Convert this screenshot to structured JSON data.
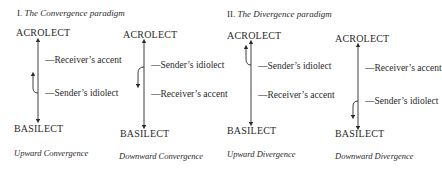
{
  "paradigms": [
    {
      "numeral": "I.",
      "title": "The Convergence paradigm",
      "diagrams": [
        {
          "top": "ACROLECT",
          "bottom": "BASILECT",
          "upper_label": "—Receiver’s accent",
          "lower_label": "—Sender’s idiolect",
          "shift_arrow": "up",
          "caption": "Upward Convergence"
        },
        {
          "top": "ACROLECT",
          "bottom": "BASILECT",
          "upper_label": "—Sender’s idiolect",
          "lower_label": "—Receiver’s accent",
          "shift_arrow": "down",
          "caption": "Downward Convergence"
        }
      ]
    },
    {
      "numeral": "II.",
      "title": "The Divergence paradigm",
      "diagrams": [
        {
          "top": "ACROLECT",
          "bottom": "BASILECT",
          "upper_label": "—Sender’s idiolect",
          "lower_label": "—Receiver’s accent",
          "shift_arrow": "up",
          "caption": "Upward Divergence"
        },
        {
          "top": "ACROLECT",
          "bottom": "BASILECT",
          "upper_label": "—Receiver’s accent",
          "lower_label": "—Sender’s idiolect",
          "shift_arrow": "down",
          "caption": "Downward Divergence"
        }
      ]
    }
  ]
}
